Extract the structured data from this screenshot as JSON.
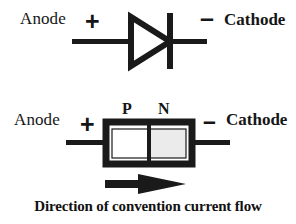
{
  "figure": {
    "background_color": "#ffffff",
    "line_color": "#1a1a1a"
  },
  "diode_symbol": {
    "anode_label": "Anode",
    "cathode_label": "Cathode",
    "plus_sign": "+",
    "minus_sign": "–",
    "triangle_fill": "#ffffff",
    "stroke_color": "#1a1a1a"
  },
  "pn_junction": {
    "anode_label": "Anode",
    "cathode_label": "Cathode",
    "plus_sign": "+",
    "minus_sign": "–",
    "p_label": "P",
    "n_label": "N",
    "p_region_fill": "#ffffff",
    "n_region_fill": "#ebebeb",
    "body_stroke": "#1a1a1a"
  },
  "current_arrow": {
    "direction": "right",
    "color": "#1a1a1a"
  },
  "caption": {
    "text": "Direction of convention current flow"
  }
}
